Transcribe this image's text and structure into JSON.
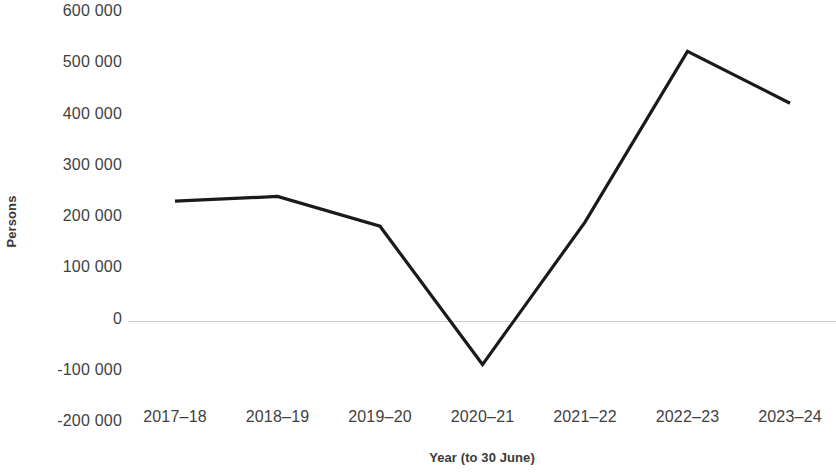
{
  "chart_data": {
    "type": "line",
    "title": "",
    "subtitle": "",
    "xlabel": "Year (to 30 June)",
    "ylabel": "Persons",
    "categories": [
      "2017–18",
      "2018–19",
      "2019–20",
      "2020–21",
      "2021–22",
      "2022–23",
      "2023–24"
    ],
    "values": [
      233000,
      242000,
      184000,
      -86000,
      192000,
      525000,
      424000
    ],
    "series": [
      {
        "name": "Net overseas migration",
        "values": [
          233000,
          242000,
          184000,
          -86000,
          192000,
          525000,
          424000
        ]
      }
    ],
    "ylim": [
      -200000,
      600000
    ],
    "ytick_values": [
      600000,
      500000,
      400000,
      300000,
      200000,
      100000,
      0,
      -100000,
      -200000
    ],
    "ytick_labels": [
      "600 000",
      "500 000",
      "400 000",
      "300 000",
      "200 000",
      "100 000",
      "0",
      "-100 000",
      "-200 000"
    ],
    "grid": false,
    "zero_line": true,
    "legend": "none",
    "line_color": "#1a1a1a",
    "zero_line_color": "#cdcdcd",
    "tick_label_color": "#3f3f3f",
    "axis_title_color": "#3a3a3a"
  }
}
